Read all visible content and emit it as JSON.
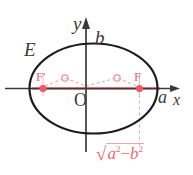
{
  "figure": {
    "background_color": "#ffffff",
    "axis_color": "#3a3a3a",
    "curve_color": "#1d1d1d",
    "accent_color": "#e8696e",
    "accent_light_color": "#f0b9bc",
    "labels": {
      "curve": "E",
      "y_axis": "y",
      "x_axis": "x",
      "origin": "O",
      "semi_minor": "b",
      "semi_major": "a",
      "focus_left": "F'",
      "focus_right": "F"
    },
    "formula": {
      "radical_sign": "√",
      "term_a": "a",
      "exp_a": "2",
      "operator": "−",
      "term_b": "b",
      "exp_b": "2",
      "full_text": "√(a²−b²)"
    },
    "geometry": {
      "center": [
        93.5,
        88.5
      ],
      "semi_axis_x": 64,
      "semi_axis_y": 45,
      "focus_left_point": [
        43,
        88.5
      ],
      "focus_right_point": [
        139.5,
        88.5
      ],
      "marker_left_point": [
        65,
        78
      ],
      "marker_right_point": [
        117,
        78
      ],
      "x_axis_from": [
        5,
        88.5
      ],
      "x_axis_to": [
        178,
        88.5
      ],
      "y_axis_from": [
        86,
        150
      ],
      "y_axis_to": [
        86,
        18
      ],
      "red_segment_from": [
        32,
        88.5
      ],
      "red_segment_to": [
        160,
        88.5
      ],
      "drop_line_from": [
        139.5,
        88.5
      ],
      "drop_line_to": [
        139.5,
        148
      ]
    }
  }
}
